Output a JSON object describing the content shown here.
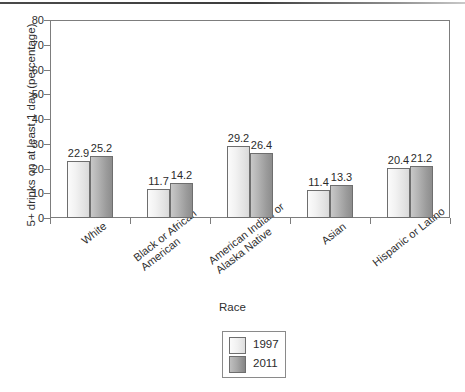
{
  "chart_data": {
    "type": "bar",
    "title": "",
    "xlabel": "Race",
    "ylabel": "5+ drinks on at least 1 day (percentage)",
    "ylim": [
      0,
      80
    ],
    "yticks": [
      0,
      10,
      20,
      30,
      40,
      50,
      60,
      70,
      80
    ],
    "grid": false,
    "legend_position": "bottom-center",
    "categories": [
      "White",
      "Black or African\nAmerican",
      "American Indian or\nAlaska Native",
      "Asian",
      "Hispanic or Latino"
    ],
    "series": [
      {
        "name": "1997",
        "values": [
          22.9,
          11.7,
          29.2,
          11.4,
          20.4
        ],
        "color": "#f0f0f0"
      },
      {
        "name": "2011",
        "values": [
          25.2,
          14.2,
          26.4,
          13.3,
          21.2
        ],
        "color": "#9a9a9a"
      }
    ]
  },
  "legend": {
    "entries": [
      {
        "label": "1997"
      },
      {
        "label": "2011"
      }
    ]
  }
}
